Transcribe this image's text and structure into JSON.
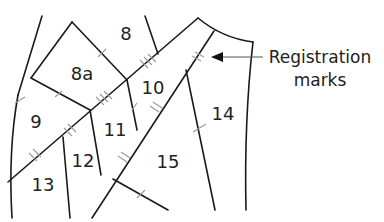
{
  "diagram": {
    "type": "pattern-pieces",
    "pieces": [
      {
        "id": "8",
        "label": "8",
        "x": 126,
        "y": 40
      },
      {
        "id": "8a",
        "label": "8a",
        "x": 82,
        "y": 78
      },
      {
        "id": "9",
        "label": "9",
        "x": 36,
        "y": 128
      },
      {
        "id": "10",
        "label": "10",
        "x": 153,
        "y": 92
      },
      {
        "id": "11",
        "label": "11",
        "x": 115,
        "y": 134
      },
      {
        "id": "12",
        "label": "12",
        "x": 82,
        "y": 167
      },
      {
        "id": "13",
        "label": "13",
        "x": 43,
        "y": 190
      },
      {
        "id": "14",
        "label": "14",
        "x": 222,
        "y": 120
      },
      {
        "id": "15",
        "label": "15",
        "x": 168,
        "y": 167
      }
    ],
    "annotation": {
      "line1": "Registration",
      "line2": "marks"
    },
    "colors": {
      "line": "#1a1a1a",
      "tick": "#9a9a9a",
      "text": "#222222"
    }
  }
}
